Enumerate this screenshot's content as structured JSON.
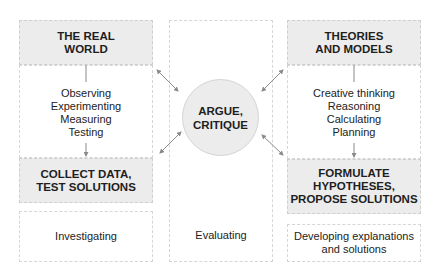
{
  "left_column": {
    "top_header": "THE REAL\nWORLD",
    "activities": [
      "Observing",
      "Experimenting",
      "Measuring",
      "Testing"
    ],
    "bottom_header": "COLLECT DATA,\nTEST SOLUTIONS",
    "footer": "Investigating"
  },
  "center_column": {
    "circle": "ARGUE,\nCRITIQUE",
    "footer": "Evaluating"
  },
  "right_column": {
    "top_header": "THEORIES\nAND MODELS",
    "activities": [
      "Creative thinking",
      "Reasoning",
      "Calculating",
      "Planning"
    ],
    "bottom_header": "FORMULATE\nHYPOTHESES,\nPROPOSE SOLUTIONS",
    "footer": "Developing explanations\nand solutions"
  },
  "colors": {
    "header_fill": "#ececec",
    "arrow": "#8a8a8a",
    "border": "#d0d0d0"
  }
}
